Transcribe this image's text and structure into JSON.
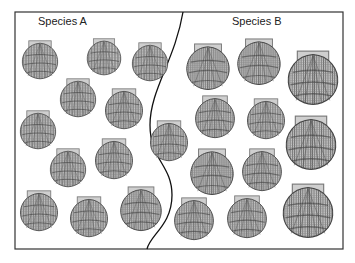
{
  "figure": {
    "regions": [
      {
        "label": "Species A",
        "label_x": 38,
        "label_y": 14,
        "shell_count": 11
      },
      {
        "label": "Species B",
        "label_x": 232,
        "label_y": 14,
        "shell_count": 12
      }
    ],
    "frame": {
      "x": 15,
      "y": 12,
      "width": 328,
      "height": 237,
      "stroke": "#333333"
    },
    "divider_path": "M183,12 C175,60 150,90 150,125 C150,160 172,165 172,195 C172,225 150,235 147,249",
    "colors": {
      "shell_light": "#d8d8d8",
      "shell_mid": "#9a9a9a",
      "shell_dark": "#555555",
      "hinge": "#c8c8c8"
    },
    "shells_a": [
      {
        "x": 20,
        "y": 40,
        "s": 40
      },
      {
        "x": 85,
        "y": 38,
        "s": 38
      },
      {
        "x": 130,
        "y": 42,
        "s": 40
      },
      {
        "x": 58,
        "y": 78,
        "s": 40
      },
      {
        "x": 103,
        "y": 88,
        "s": 42
      },
      {
        "x": 18,
        "y": 110,
        "s": 40
      },
      {
        "x": 48,
        "y": 148,
        "s": 40
      },
      {
        "x": 93,
        "y": 138,
        "s": 42
      },
      {
        "x": 18,
        "y": 190,
        "s": 42
      },
      {
        "x": 68,
        "y": 196,
        "s": 42
      },
      {
        "x": 118,
        "y": 186,
        "s": 46
      }
    ],
    "shells_b": [
      {
        "x": 184,
        "y": 43,
        "s": 48
      },
      {
        "x": 235,
        "y": 38,
        "s": 48
      },
      {
        "x": 285,
        "y": 50,
        "s": 56
      },
      {
        "x": 148,
        "y": 120,
        "s": 42
      },
      {
        "x": 193,
        "y": 95,
        "s": 44
      },
      {
        "x": 245,
        "y": 98,
        "s": 42
      },
      {
        "x": 283,
        "y": 115,
        "s": 56
      },
      {
        "x": 188,
        "y": 148,
        "s": 48
      },
      {
        "x": 240,
        "y": 148,
        "s": 44
      },
      {
        "x": 172,
        "y": 197,
        "s": 44
      },
      {
        "x": 225,
        "y": 195,
        "s": 44
      },
      {
        "x": 280,
        "y": 183,
        "s": 56
      }
    ]
  }
}
